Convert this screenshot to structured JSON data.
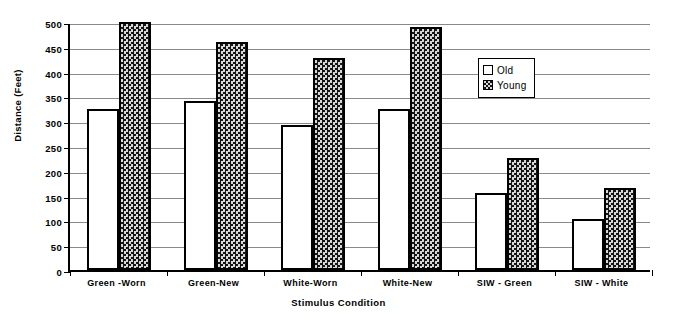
{
  "chart_data": {
    "type": "bar",
    "title": "",
    "xlabel": "Stimulus Condition",
    "ylabel": "Distance (Feet)",
    "categories": [
      "Green -Worn",
      "Green-New",
      "White-Worn",
      "White-New",
      "SIW - Green",
      "SIW - White"
    ],
    "series": [
      {
        "name": "Old",
        "values": [
          325,
          340,
          292,
          325,
          155,
          102
        ]
      },
      {
        "name": "Young",
        "values": [
          500,
          460,
          427,
          490,
          225,
          165
        ]
      }
    ],
    "ylim": [
      0,
      500
    ],
    "yticks": [
      0,
      50,
      100,
      150,
      200,
      250,
      300,
      350,
      400,
      450,
      500
    ],
    "ytick_labels": [
      "0",
      "50",
      "100",
      "150",
      "200",
      "250",
      "300",
      "350",
      "400",
      "450",
      "500"
    ],
    "grid": true,
    "legend_position": "inside-upper-right",
    "colors": {
      "old_fill": "#ffffff",
      "young_fill": "#2a2a2a",
      "outline": "#000000",
      "gridline": "#8a8a8a",
      "axis": "#000000",
      "background": "#ffffff"
    }
  },
  "legend": {
    "items": [
      {
        "label": "Old",
        "swatch": "white-square-icon"
      },
      {
        "label": "Young",
        "swatch": "checkered-square-icon"
      }
    ]
  }
}
